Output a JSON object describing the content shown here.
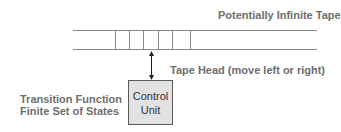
{
  "diagram": {
    "title_tape": "Potentially Infinite Tape",
    "tape_head_label": "Tape Head (move left or right)",
    "control_unit": {
      "line1": "Control",
      "line2": "Unit"
    },
    "left_labels": {
      "line1": "Transition Function",
      "line2": "Finite Set of States"
    },
    "colors": {
      "text": "#6e6e6e",
      "tape_line": "#8a8a8a",
      "box_fill": "#e2e2e2",
      "box_border": "#5a5a5a",
      "arrow": "#222222"
    }
  }
}
